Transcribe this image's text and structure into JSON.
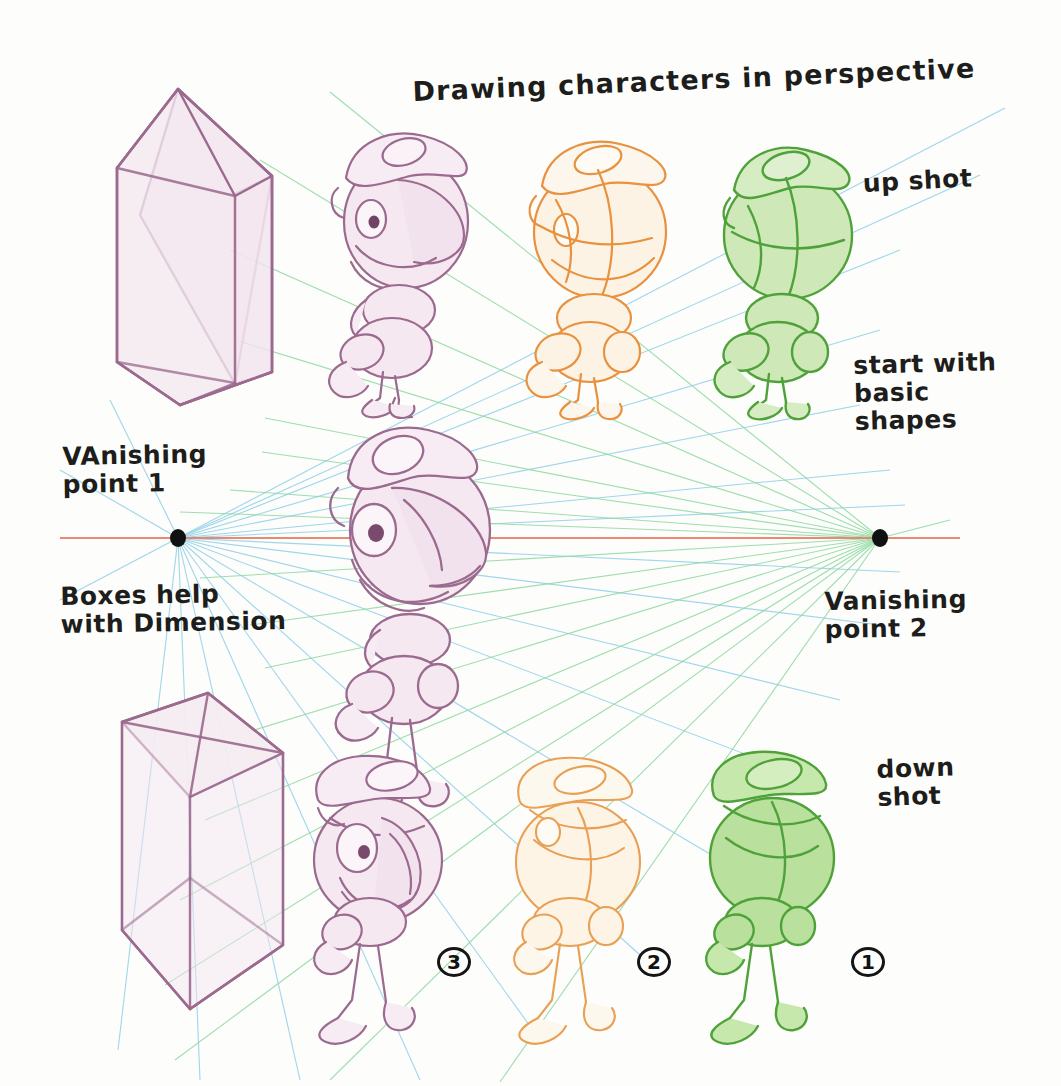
{
  "canvas": {
    "width": 1061,
    "height": 1086,
    "background": "#fdfdfc",
    "medium": "pencil-sketch-on-paper"
  },
  "title": {
    "text": "Drawing characters in perspective"
  },
  "annotations": {
    "up_shot": "up shot",
    "start_with_basic_shapes": "start with\nbasic\n shapes",
    "vanishing_point_1": "VAnishing\npoint 1",
    "boxes_help": "Boxes help\nwith Dimension",
    "vanishing_point_2": "Vanishing\npoint 2",
    "down_shot": "down\n shot"
  },
  "steps": [
    {
      "number": "1",
      "color": "#4fa23a",
      "stage": "basic shapes",
      "row": "down shot"
    },
    {
      "number": "2",
      "color": "#e8a055",
      "stage": "construction",
      "row": "down shot"
    },
    {
      "number": "3",
      "color": "#9b6a8e",
      "stage": "finished sketch",
      "row": "down shot"
    }
  ],
  "colors": {
    "horizon_line": "#e8836a",
    "vp1_rays": "#8fd0e8",
    "vp2_rays": "#8ed9a0",
    "purple_pencil": "#9b6a8e",
    "purple_fill": "#f3e6ef",
    "orange_pencil": "#e8913f",
    "orange_fill": "#fdf0de",
    "green_pencil": "#4fa23a",
    "green_fill": "#cfe8b8",
    "vanishing_dot": "#111111",
    "ink": "#1d1d1b"
  },
  "geometry": {
    "vanishing_point_1": {
      "x": 178,
      "y": 538
    },
    "vanishing_point_2": {
      "x": 880,
      "y": 538
    },
    "horizon_line": {
      "x1": 60,
      "y1": 538,
      "x2": 960,
      "y2": 538
    }
  },
  "figures": [
    {
      "id": "box-up-shot",
      "type": "wireframe-cube",
      "view": "up shot",
      "color": "#9b6a8e"
    },
    {
      "id": "character-row1-purple",
      "type": "character",
      "stage": "finished",
      "color": "#9b6a8e"
    },
    {
      "id": "character-row1-orange",
      "type": "character",
      "stage": "construction",
      "color": "#e8913f"
    },
    {
      "id": "character-row1-green",
      "type": "character",
      "stage": "basic shapes",
      "color": "#4fa23a"
    },
    {
      "id": "character-row2-purple",
      "type": "character",
      "stage": "finished",
      "color": "#9b6a8e"
    },
    {
      "id": "box-down-shot",
      "type": "wireframe-cube",
      "view": "down shot",
      "color": "#9b6a8e"
    },
    {
      "id": "character-row3-purple",
      "type": "character",
      "stage": "finished",
      "color": "#9b6a8e"
    },
    {
      "id": "character-row3-orange",
      "type": "character",
      "stage": "construction",
      "color": "#e8913f"
    },
    {
      "id": "character-row3-green",
      "type": "character",
      "stage": "basic shapes",
      "color": "#4fa23a"
    }
  ]
}
